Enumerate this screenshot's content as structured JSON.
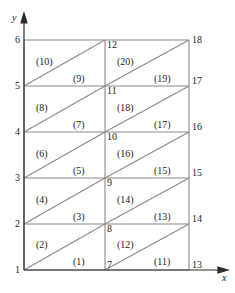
{
  "figure": {
    "type": "finite-element-mesh",
    "colors": {
      "line": "#8a8a8a",
      "text": "#232323",
      "axis": "#2b2b2b",
      "background": "#ffffff"
    }
  },
  "axes": {
    "x_name": "x",
    "y_name": "y",
    "y_ticks": [
      "6",
      "5",
      "4",
      "3",
      "2",
      "1"
    ]
  },
  "elements": [
    {
      "label": "(1)",
      "x": 73,
      "y": 257
    },
    {
      "label": "(2)",
      "x": 36,
      "y": 240
    },
    {
      "label": "(3)",
      "x": 73,
      "y": 212
    },
    {
      "label": "(4)",
      "x": 36,
      "y": 195
    },
    {
      "label": "(5)",
      "x": 73,
      "y": 166
    },
    {
      "label": "(6)",
      "x": 36,
      "y": 149
    },
    {
      "label": "(7)",
      "x": 73,
      "y": 120
    },
    {
      "label": "(8)",
      "x": 36,
      "y": 103
    },
    {
      "label": "(9)",
      "x": 73,
      "y": 74
    },
    {
      "label": "(10)",
      "x": 36,
      "y": 57
    },
    {
      "label": "(11)",
      "x": 154,
      "y": 257
    },
    {
      "label": "(12)",
      "x": 117,
      "y": 240
    },
    {
      "label": "(13)",
      "x": 154,
      "y": 212
    },
    {
      "label": "(14)",
      "x": 117,
      "y": 195
    },
    {
      "label": "(15)",
      "x": 154,
      "y": 166
    },
    {
      "label": "(16)",
      "x": 117,
      "y": 149
    },
    {
      "label": "(17)",
      "x": 154,
      "y": 120
    },
    {
      "label": "(18)",
      "x": 117,
      "y": 103
    },
    {
      "label": "(19)",
      "x": 154,
      "y": 74
    },
    {
      "label": "(20)",
      "x": 117,
      "y": 57
    }
  ],
  "nodes": [
    {
      "label": "1",
      "x": 15,
      "y": 265
    },
    {
      "label": "2",
      "x": 15,
      "y": 219
    },
    {
      "label": "3",
      "x": 15,
      "y": 173
    },
    {
      "label": "4",
      "x": 15,
      "y": 127
    },
    {
      "label": "5",
      "x": 15,
      "y": 81
    },
    {
      "label": "6",
      "x": 15,
      "y": 35
    },
    {
      "label": "7",
      "x": 107,
      "y": 260
    },
    {
      "label": "8",
      "x": 107,
      "y": 224
    },
    {
      "label": "9",
      "x": 107,
      "y": 178
    },
    {
      "label": "10",
      "x": 107,
      "y": 132
    },
    {
      "label": "11",
      "x": 107,
      "y": 86
    },
    {
      "label": "12",
      "x": 107,
      "y": 40
    },
    {
      "label": "13",
      "x": 192,
      "y": 260
    },
    {
      "label": "14",
      "x": 192,
      "y": 214
    },
    {
      "label": "15",
      "x": 192,
      "y": 168
    },
    {
      "label": "16",
      "x": 192,
      "y": 122
    },
    {
      "label": "17",
      "x": 192,
      "y": 76
    },
    {
      "label": "18",
      "x": 192,
      "y": 35
    }
  ],
  "geometry": {
    "left": 24,
    "mid": 105,
    "right": 189,
    "top": 40,
    "bottom": 270,
    "rows": [
      40,
      86,
      132,
      178,
      224,
      270
    ]
  }
}
